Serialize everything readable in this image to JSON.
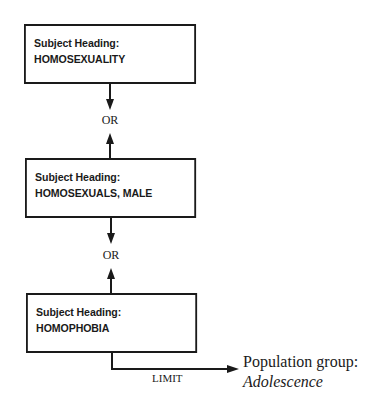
{
  "diagram": {
    "type": "search-strategy-flowchart",
    "nodes": [
      {
        "id": "box1",
        "heading_label": "Subject Heading:",
        "term": "HOMOSEXUALITY"
      },
      {
        "id": "box2",
        "heading_label": "Subject Heading:",
        "term": "HOMOSEXUALS, MALE"
      },
      {
        "id": "box3",
        "heading_label": "Subject Heading:",
        "term": "HOMOPHOBIA"
      }
    ],
    "connectors": [
      {
        "from": "box1",
        "to": "box2",
        "label": "OR",
        "style": "bidirectional"
      },
      {
        "from": "box2",
        "to": "box3",
        "label": "OR",
        "style": "bidirectional"
      },
      {
        "from": "box3",
        "to": "population",
        "label": "LIMIT",
        "style": "elbow-arrow"
      }
    ],
    "limit_target": {
      "label": "Population group:",
      "value": "Adolescence"
    },
    "colors": {
      "stroke": "#1a1a1a",
      "background": "#ffffff"
    }
  }
}
